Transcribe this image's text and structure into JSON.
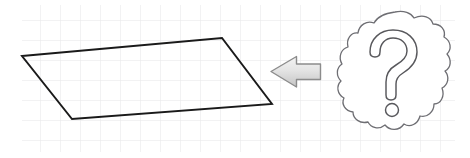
{
  "canvas": {
    "width": 470,
    "height": 158,
    "background": "#ffffff",
    "alt_text": "Hand-drawn style diagram: a parallelogram on graph paper, a gray left-pointing arrow, and a thought cloud containing a question mark."
  },
  "grid": {
    "name": "graph-paper-grid",
    "x": 22,
    "y": 5,
    "width": 433,
    "height": 147,
    "cell_size": 20,
    "line_color": "#e6e6e8",
    "line_width": 1,
    "background": "#ffffff"
  },
  "shapes": {
    "parallelogram": {
      "label": "parallelogram",
      "points": "22,56 222,38 272,104 72,119",
      "stroke": "#1a1a1a",
      "stroke_width": 1.8,
      "fill": "none"
    },
    "arrow": {
      "label": "left-pointing-arrow",
      "direction": "left",
      "points": "272,71 296,57 296,64 320,64 320,79 296,79 296,86",
      "stroke": "#8c8c8c",
      "stroke_width": 1.4,
      "fill_top": "#f2f2f2",
      "fill_bottom": "#c9c9c9"
    },
    "thought_cloud": {
      "label": "thought-cloud",
      "center_x": 395,
      "center_y": 72,
      "radius_x": 52,
      "radius_y": 60,
      "bumps": 16,
      "bump_depth": 5,
      "stroke": "#6e6e73",
      "stroke_width": 1.3,
      "fill": "#ffffff"
    },
    "question_mark": {
      "label": "question-mark-glyph",
      "character": "?",
      "stroke": "#58585c",
      "stroke_width": 1.4,
      "fill": "#ffffff",
      "dot_center_x": 392,
      "dot_center_y": 110,
      "dot_radius": 6.5
    }
  },
  "colors": {
    "ink": "#1a1a1a",
    "grid": "#e6e6e8",
    "arrow_outline": "#8c8c8c",
    "cloud_outline": "#6e6e73",
    "paper": "#ffffff"
  }
}
